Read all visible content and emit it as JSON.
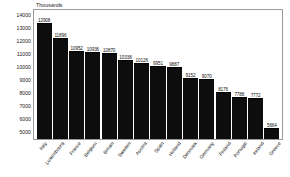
{
  "chart": {
    "axis_title": "Thousands",
    "y_ticks": [
      "14000",
      "13000",
      "12000",
      "11000",
      "10000",
      "9000",
      "8000",
      "7000",
      "6000",
      "5000"
    ]
  },
  "chart_data": {
    "type": "bar",
    "title": "",
    "subtitle": "",
    "xlabel": "",
    "ylabel": "Thousands",
    "ylim": [
      5000,
      14000
    ],
    "grid": false,
    "legend": "none",
    "bar_color": "#0d0d0d",
    "categories": [
      "Italy",
      "Luxembourg",
      "France",
      "Belgium",
      "Britain",
      "Sweden",
      "Austria",
      "Spain",
      "Holland",
      "Denmark",
      "Germany",
      "Finland",
      "Portugal",
      "Ireland",
      "Greece"
    ],
    "values": [
      12908,
      11896,
      10952,
      10936,
      10870,
      10338,
      10126,
      9951,
      9887,
      9152,
      9070,
      8176,
      7788,
      7772,
      5664
    ],
    "data_labels": [
      "12908",
      "11896",
      "10952",
      "10936",
      "10870",
      "10338",
      "10126",
      "9951",
      "9887",
      "9152",
      "9070",
      "8176",
      "7788",
      "7772",
      "5664"
    ]
  }
}
